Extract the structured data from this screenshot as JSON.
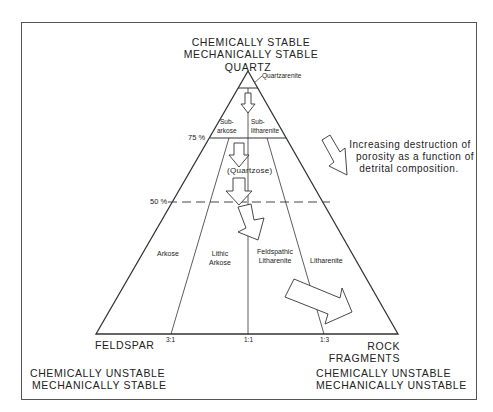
{
  "header": {
    "top_line1": "CHEMICALLY  STABLE",
    "top_line2": "MECHANICALLY STABLE"
  },
  "vertices": {
    "top": "QUARTZ",
    "bottom_left": "FELDSPAR",
    "bottom_right_line1": "ROCK",
    "bottom_right_line2": "FRAGMENTS"
  },
  "stability": {
    "bottom_left_line1": "CHEMICALLY UNSTABLE",
    "bottom_left_line2": "MECHANICALLY STABLE",
    "bottom_right_line1": "CHEMICALLY UNSTABLE",
    "bottom_right_line2": "MECHANICALLY UNSTABLE"
  },
  "percent_labels": {
    "p75": "75 %",
    "p50": "50 %"
  },
  "ratio_labels": {
    "r31": "3:1",
    "r11": "1:1",
    "r13": "1:3"
  },
  "fields": {
    "quartzarenite": "Quartzarenite",
    "subarkose_1": "Sub-",
    "subarkose_2": "arkose",
    "sublitharenite_1": "Sub-",
    "sublitharenite_2": "litharenite",
    "quartzose": "(Quartzose)",
    "arkose": "Arkose",
    "lithic_arkose_1": "Lithic",
    "lithic_arkose_2": "Arkose",
    "feldspathic_litharenite_1": "Feldspathic",
    "feldspathic_litharenite_2": "Litharenite",
    "litharenite": "Litharenite"
  },
  "annotation": {
    "line1": "Increasing destruction of",
    "line2": "porosity as a function of",
    "line3": "detrital composition."
  },
  "colors": {
    "line": "#333333",
    "frame": "#555555",
    "background": "#ffffff"
  }
}
